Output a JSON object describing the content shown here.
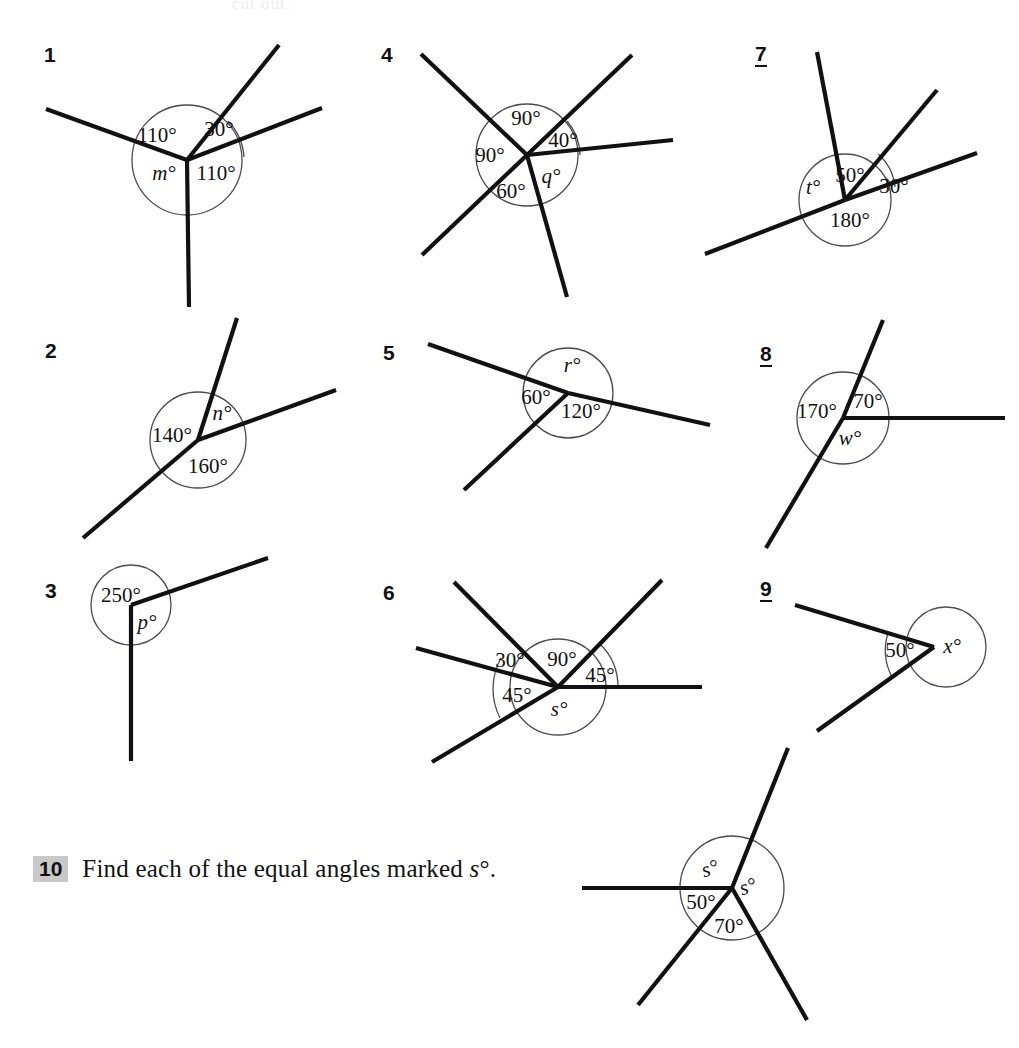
{
  "page": {
    "top_partial_text": "cut out.",
    "background": "#ffffff",
    "ink": "#111111",
    "arc_color": "#4a4a52",
    "highlight": "#c9c9c9"
  },
  "question10": {
    "number": "10",
    "text_before": "Find each of the equal angles marked ",
    "variable": "s",
    "degree": "°",
    "text_after": "."
  },
  "questions": [
    {
      "number": "1",
      "underlined": false,
      "labels": [
        "110°",
        "30°",
        "110°",
        "m°"
      ],
      "unknown": "m",
      "known_angles": [
        110,
        30,
        110
      ]
    },
    {
      "number": "2",
      "underlined": false,
      "labels": [
        "140°",
        "n°",
        "160°"
      ],
      "unknown": "n",
      "known_angles": [
        140,
        160
      ]
    },
    {
      "number": "3",
      "underlined": false,
      "labels": [
        "250°",
        "p°"
      ],
      "unknown": "p",
      "known_angles": [
        250
      ]
    },
    {
      "number": "4",
      "underlined": false,
      "labels": [
        "90°",
        "40°",
        "90°",
        "60°",
        "q°"
      ],
      "unknown": "q",
      "known_angles": [
        90,
        40,
        90,
        60
      ]
    },
    {
      "number": "5",
      "underlined": false,
      "labels": [
        "r°",
        "60°",
        "120°"
      ],
      "unknown": "r",
      "known_angles": [
        60,
        120
      ]
    },
    {
      "number": "6",
      "underlined": false,
      "labels": [
        "30°",
        "90°",
        "45°",
        "45°",
        "s°"
      ],
      "unknown": "s",
      "known_angles": [
        30,
        90,
        45,
        45
      ]
    },
    {
      "number": "7",
      "underlined": true,
      "labels": [
        "50°",
        "30°",
        "t°",
        "180°"
      ],
      "unknown": "t",
      "known_angles": [
        50,
        30,
        180
      ]
    },
    {
      "number": "8",
      "underlined": true,
      "labels": [
        "170°",
        "70°",
        "w°"
      ],
      "unknown": "w",
      "known_angles": [
        170,
        70
      ]
    },
    {
      "number": "9",
      "underlined": true,
      "labels": [
        "50°",
        "x°"
      ],
      "unknown": "x",
      "known_angles": [
        50
      ]
    },
    {
      "number": "10",
      "underlined": false,
      "labels": [
        "s°",
        "s°",
        "50°",
        "70°"
      ],
      "unknown": "s",
      "known_angles": [
        50,
        70
      ]
    }
  ]
}
